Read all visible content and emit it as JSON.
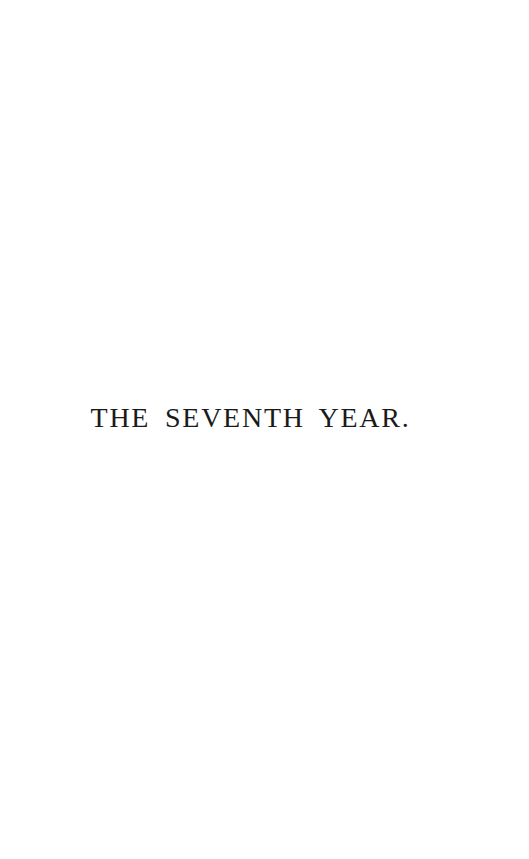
{
  "page": {
    "background_color": "#ffffff",
    "ink_color": "#1a1a1a",
    "kind": "book-section-half-title-page"
  },
  "heading": {
    "text": "THE SEVENTH YEAR."
  }
}
